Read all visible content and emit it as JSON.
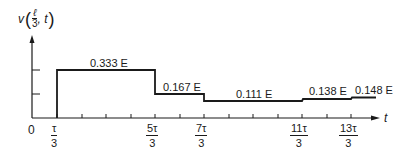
{
  "figure": {
    "y_axis_label": {
      "prefix": "v",
      "frac_num": "ℓ",
      "frac_den": "3",
      "suffix": ", t"
    },
    "x_axis_label": "t",
    "origin_label": "0",
    "x_ticks": [
      {
        "num": "τ",
        "den": "3"
      },
      {
        "num": "5τ",
        "den": "3"
      },
      {
        "num": "7τ",
        "den": "3"
      },
      {
        "num": "11τ",
        "den": "3"
      },
      {
        "num": "13τ",
        "den": "3"
      }
    ],
    "segments": [
      {
        "label": "0.333 E",
        "from": "τ/3",
        "to": "5τ/3",
        "value": 0.333
      },
      {
        "label": "0.167 E",
        "from": "5τ/3",
        "to": "7τ/3",
        "value": 0.167
      },
      {
        "label": "0.111 E",
        "from": "7τ/3",
        "to": "11τ/3",
        "value": 0.111
      },
      {
        "label": "0.138 E",
        "from": "11τ/3",
        "to": "13τ/3",
        "value": 0.138
      },
      {
        "label": "0.148 E",
        "from": "13τ/3",
        "to": "5τ",
        "value": 0.148
      }
    ],
    "colors": {
      "ink": "#1a1a1a",
      "background": "#ffffff"
    }
  }
}
